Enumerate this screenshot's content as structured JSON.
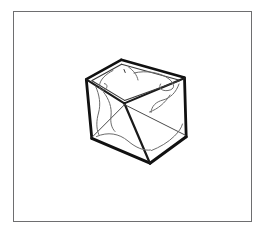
{
  "artwork": {
    "title": "Open-top transparent glass cube",
    "subject": "glass-box",
    "medium": "hand-drawn ink line illustration",
    "style": "black outline on white, no fill",
    "caption": "",
    "background_color": "#ffffff"
  },
  "frame": {
    "label": "thin rectangular border",
    "color": "#6e6e70",
    "stroke_width": 1.5,
    "x": 13,
    "y": 11,
    "width": 239,
    "height": 211
  },
  "palette": {
    "paper": "#ffffff",
    "frame_gray": "#6e6e70",
    "ink_heavy": "#111111",
    "ink_medium": "#2b2b2b",
    "ink_light": "#555555",
    "ink_faint": "#777777"
  },
  "cube": {
    "label": "open-top glass cube",
    "vertices": {
      "top_left": [
        86,
        79
      ],
      "top_back": [
        121,
        60
      ],
      "top_right": [
        184,
        78
      ],
      "top_front": [
        124,
        103
      ],
      "bottom_left": [
        92,
        138
      ],
      "bottom_right": [
        186,
        137
      ],
      "bottom_front": [
        150,
        163
      ],
      "bottom_back": [
        124,
        103
      ]
    },
    "edges": [
      {
        "name": "rim-back-left",
        "from": "top_left",
        "to": "top_back",
        "weight": "heavy"
      },
      {
        "name": "rim-back-right",
        "from": "top_back",
        "to": "top_right",
        "weight": "heavy"
      },
      {
        "name": "rim-front-left",
        "from": "top_left",
        "to": "top_front",
        "weight": "medium"
      },
      {
        "name": "rim-front-right",
        "from": "top_front",
        "to": "top_right",
        "weight": "medium"
      },
      {
        "name": "vertical-left",
        "from": "top_left",
        "to": "bottom_left",
        "weight": "heavy"
      },
      {
        "name": "vertical-right",
        "from": "top_right",
        "to": "bottom_right",
        "weight": "heavy"
      },
      {
        "name": "vertical-front",
        "from": "top_front",
        "to": "bottom_front",
        "weight": "heavy"
      },
      {
        "name": "base-left",
        "from": "bottom_left",
        "to": "bottom_front",
        "weight": "heavy"
      },
      {
        "name": "base-right",
        "from": "bottom_front",
        "to": "bottom_right",
        "weight": "heavy"
      },
      {
        "name": "base-back-left",
        "from": "bottom_left",
        "to": "bottom_back",
        "weight": "light"
      },
      {
        "name": "base-back-right",
        "from": "bottom_back",
        "to": "bottom_right",
        "weight": "light"
      }
    ],
    "inner_rim": {
      "label": "glass wall thickness inset along the open top",
      "weight": "light"
    },
    "reflections": {
      "label": "wavy highlight strokes suggesting transparent glass",
      "count": 6,
      "weight": "faint"
    }
  }
}
